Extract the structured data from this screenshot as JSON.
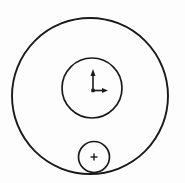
{
  "figure": {
    "name": "concentric-circles-with-axis-marker",
    "type": "line-diagram",
    "width": 185,
    "height": 183,
    "background_color": "#fdfdfd",
    "stroke_color": "#1a1a1a",
    "fill_color": "none"
  },
  "shapes": {
    "outer_circle": {
      "label": "outer-circle",
      "cx": 90,
      "cy": 96,
      "r": 78,
      "stroke_width": 1.9,
      "fill": "none"
    },
    "inner_circle": {
      "label": "inner-circle",
      "cx": 92,
      "cy": 88,
      "r": 30,
      "stroke_width": 1.7,
      "fill": "none"
    },
    "small_circle": {
      "label": "small-circle",
      "cx": 94,
      "cy": 157,
      "r": 15.5,
      "stroke_width": 1.7,
      "fill": "none"
    }
  },
  "axis_marker": {
    "label": "coordinate-axis-marker",
    "origin_x": 93,
    "origin_y": 91,
    "vertical_arrow": {
      "label": "y-axis-arrow-up",
      "from_y": 91,
      "to_y": 69,
      "stroke_width": 1.6,
      "head_width": 5,
      "head_length": 7
    },
    "horizontal_arrow": {
      "label": "x-axis-arrow-right",
      "from_x": 93,
      "to_x": 108,
      "stroke_width": 1.6,
      "head_width": 5,
      "head_length": 6
    }
  },
  "center_cross": {
    "label": "center-cross-mark",
    "cx": 94,
    "cy": 157,
    "arm_length": 3.5,
    "stroke_width": 1.4
  }
}
